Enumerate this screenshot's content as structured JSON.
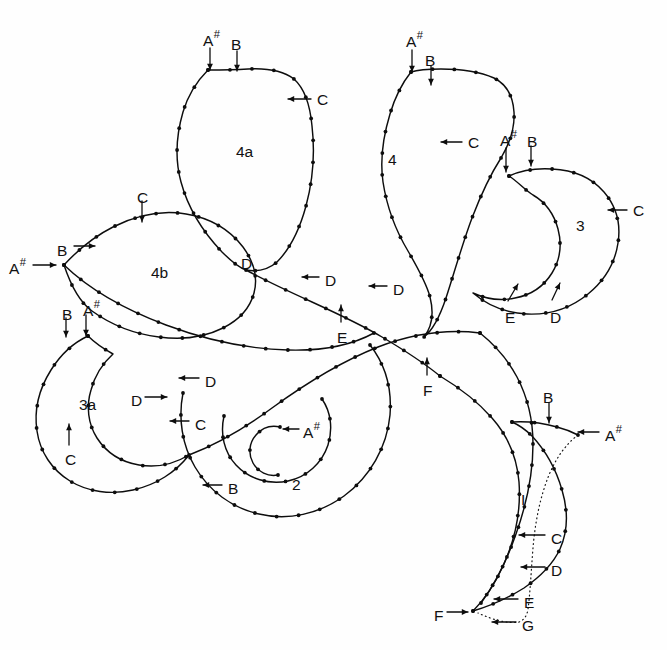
{
  "figure": {
    "type": "line-diagram",
    "background_color": "#fefefe",
    "line_color": "#0d0d0d",
    "canvas": {
      "width": 667,
      "height": 650
    }
  },
  "region_labels": [
    {
      "id": "region-4a",
      "text": "4a",
      "x": 236,
      "y": 144
    },
    {
      "id": "region-4",
      "text": "4",
      "x": 388,
      "y": 152
    },
    {
      "id": "region-3",
      "text": "3",
      "x": 576,
      "y": 218
    },
    {
      "id": "region-4b",
      "text": "4b",
      "x": 151,
      "y": 265
    },
    {
      "id": "region-3a",
      "text": "3a",
      "x": 79,
      "y": 397
    },
    {
      "id": "region-2",
      "text": "2",
      "x": 292,
      "y": 477
    }
  ],
  "landmark_labels": [
    {
      "id": "lbl-4a-asharp",
      "base": "A",
      "sup": "#",
      "x": 203,
      "y": 33
    },
    {
      "id": "lbl-4a-b",
      "base": "B",
      "sup": "",
      "x": 231,
      "y": 37
    },
    {
      "id": "lbl-4a-c",
      "base": "C",
      "sup": "",
      "x": 317,
      "y": 92
    },
    {
      "id": "lbl-4-asharp",
      "base": "A",
      "sup": "#",
      "x": 406,
      "y": 34
    },
    {
      "id": "lbl-4-b",
      "base": "B",
      "sup": "",
      "x": 425,
      "y": 53
    },
    {
      "id": "lbl-4-c",
      "base": "C",
      "sup": "",
      "x": 468,
      "y": 135
    },
    {
      "id": "lbl-3-asharp",
      "base": "A",
      "sup": "#",
      "x": 500,
      "y": 133
    },
    {
      "id": "lbl-3-b",
      "base": "B",
      "sup": "",
      "x": 527,
      "y": 134
    },
    {
      "id": "lbl-3-c",
      "base": "C",
      "sup": "",
      "x": 633,
      "y": 203
    },
    {
      "id": "lbl-3-e",
      "base": "E",
      "sup": "",
      "x": 505,
      "y": 310
    },
    {
      "id": "lbl-3-d",
      "base": "D",
      "sup": "",
      "x": 550,
      "y": 310
    },
    {
      "id": "lbl-4b-c",
      "base": "C",
      "sup": "",
      "x": 137,
      "y": 190
    },
    {
      "id": "lbl-4b-b",
      "base": "B",
      "sup": "",
      "x": 57,
      "y": 243
    },
    {
      "id": "lbl-4b-asharp",
      "base": "A",
      "sup": "#",
      "x": 9,
      "y": 261
    },
    {
      "id": "lbl-3a-b",
      "base": "B",
      "sup": "",
      "x": 62,
      "y": 307
    },
    {
      "id": "lbl-3a-asharp",
      "base": "A",
      "sup": "#",
      "x": 83,
      "y": 303
    },
    {
      "id": "lbl-3a-c",
      "base": "C",
      "sup": "",
      "x": 65,
      "y": 452
    },
    {
      "id": "lbl-4a-d",
      "base": "D",
      "sup": "",
      "x": 241,
      "y": 256
    },
    {
      "id": "lbl-4-dleft",
      "base": "D",
      "sup": "",
      "x": 325,
      "y": 273
    },
    {
      "id": "lbl-4-dright",
      "base": "D",
      "sup": "",
      "x": 393,
      "y": 282
    },
    {
      "id": "lbl-centre-e",
      "base": "E",
      "sup": "",
      "x": 337,
      "y": 330
    },
    {
      "id": "lbl-centre-f",
      "base": "F",
      "sup": "",
      "x": 423,
      "y": 383
    },
    {
      "id": "lbl-2-dupper",
      "base": "D",
      "sup": "",
      "x": 205,
      "y": 374
    },
    {
      "id": "lbl-2-dleft",
      "base": "D",
      "sup": "",
      "x": 131,
      "y": 393
    },
    {
      "id": "lbl-2-c",
      "base": "C",
      "sup": "",
      "x": 195,
      "y": 417
    },
    {
      "id": "lbl-2-asharp",
      "base": "A",
      "sup": "#",
      "x": 303,
      "y": 425
    },
    {
      "id": "lbl-2-b",
      "base": "B",
      "sup": "",
      "x": 228,
      "y": 481
    },
    {
      "id": "lbl-tail-b",
      "base": "B",
      "sup": "",
      "x": 543,
      "y": 390
    },
    {
      "id": "lbl-tail-asharp",
      "base": "A",
      "sup": "#",
      "x": 605,
      "y": 428
    },
    {
      "id": "lbl-tail-i",
      "base": "I",
      "sup": "",
      "x": 521,
      "y": 492
    },
    {
      "id": "lbl-tail-c",
      "base": "C",
      "sup": "",
      "x": 551,
      "y": 531
    },
    {
      "id": "lbl-tail-d",
      "base": "D",
      "sup": "",
      "x": 551,
      "y": 563
    },
    {
      "id": "lbl-tail-e",
      "base": "E",
      "sup": "",
      "x": 524,
      "y": 595
    },
    {
      "id": "lbl-tail-f",
      "base": "F",
      "sup": "",
      "x": 434,
      "y": 608
    },
    {
      "id": "lbl-tail-g",
      "base": "G",
      "sup": "",
      "x": 522,
      "y": 618
    }
  ],
  "arrows": [
    {
      "id": "arrow-4a-asharp",
      "from": [
        210,
        48
      ],
      "to": [
        210,
        70
      ],
      "head": "down"
    },
    {
      "id": "arrow-4a-b",
      "from": [
        237,
        51
      ],
      "to": [
        237,
        71
      ],
      "head": "down"
    },
    {
      "id": "arrow-4a-c",
      "from": [
        311,
        99
      ],
      "to": [
        288,
        99
      ],
      "head": "left"
    },
    {
      "id": "arrow-4-asharp",
      "from": [
        412,
        50
      ],
      "to": [
        412,
        72
      ],
      "head": "down"
    },
    {
      "id": "arrow-4-b",
      "from": [
        431,
        66
      ],
      "to": [
        431,
        85
      ],
      "head": "down"
    },
    {
      "id": "arrow-4-c",
      "from": [
        462,
        142
      ],
      "to": [
        441,
        142
      ],
      "head": "left"
    },
    {
      "id": "arrow-3-asharp",
      "from": [
        506,
        148
      ],
      "to": [
        506,
        172
      ],
      "head": "down"
    },
    {
      "id": "arrow-3-b",
      "from": [
        531,
        146
      ],
      "to": [
        531,
        166
      ],
      "head": "down"
    },
    {
      "id": "arrow-3-c",
      "from": [
        627,
        210
      ],
      "to": [
        608,
        210
      ],
      "head": "left"
    },
    {
      "id": "arrow-3-e",
      "from": [
        508,
        301
      ],
      "to": [
        518,
        284
      ],
      "head": "upright"
    },
    {
      "id": "arrow-3-d",
      "from": [
        552,
        300
      ],
      "to": [
        560,
        283
      ],
      "head": "upright"
    },
    {
      "id": "arrow-4b-c",
      "from": [
        142,
        201
      ],
      "to": [
        142,
        222
      ],
      "head": "down"
    },
    {
      "id": "arrow-4b-b",
      "from": [
        74,
        246
      ],
      "to": [
        95,
        246
      ],
      "head": "right"
    },
    {
      "id": "arrow-4b-asharp",
      "from": [
        33,
        265
      ],
      "to": [
        56,
        265
      ],
      "head": "right"
    },
    {
      "id": "arrow-3a-b",
      "from": [
        66,
        318
      ],
      "to": [
        66,
        337
      ],
      "head": "down"
    },
    {
      "id": "arrow-3a-asharp",
      "from": [
        86,
        315
      ],
      "to": [
        86,
        336
      ],
      "head": "down"
    },
    {
      "id": "arrow-3a-c",
      "from": [
        69,
        445
      ],
      "to": [
        69,
        424
      ],
      "head": "up"
    },
    {
      "id": "arrow-2-dupper",
      "from": [
        199,
        378
      ],
      "to": [
        179,
        378
      ],
      "head": "left"
    },
    {
      "id": "arrow-2-dleft",
      "from": [
        145,
        397
      ],
      "to": [
        167,
        397
      ],
      "head": "right"
    },
    {
      "id": "arrow-2-c",
      "from": [
        189,
        421
      ],
      "to": [
        170,
        421
      ],
      "head": "left"
    },
    {
      "id": "arrow-2-asharp",
      "from": [
        299,
        429
      ],
      "to": [
        283,
        429
      ],
      "head": "left"
    },
    {
      "id": "arrow-2-b",
      "from": [
        222,
        485
      ],
      "to": [
        203,
        485
      ],
      "head": "left"
    },
    {
      "id": "arrow-4-dleft",
      "from": [
        319,
        277
      ],
      "to": [
        302,
        277
      ],
      "head": "left"
    },
    {
      "id": "arrow-4-dright",
      "from": [
        387,
        286
      ],
      "to": [
        369,
        286
      ],
      "head": "left"
    },
    {
      "id": "arrow-centre-e",
      "from": [
        341,
        322
      ],
      "to": [
        341,
        305
      ],
      "head": "up"
    },
    {
      "id": "arrow-centre-f",
      "from": [
        427,
        375
      ],
      "to": [
        427,
        358
      ],
      "head": "up"
    },
    {
      "id": "arrow-tail-b",
      "from": [
        549,
        403
      ],
      "to": [
        549,
        423
      ],
      "head": "down"
    },
    {
      "id": "arrow-tail-asharp",
      "from": [
        599,
        432
      ],
      "to": [
        578,
        432
      ],
      "head": "left"
    },
    {
      "id": "arrow-tail-c",
      "from": [
        545,
        535
      ],
      "to": [
        519,
        535
      ],
      "head": "left"
    },
    {
      "id": "arrow-tail-d",
      "from": [
        545,
        567
      ],
      "to": [
        521,
        567
      ],
      "head": "left"
    },
    {
      "id": "arrow-tail-e",
      "from": [
        518,
        599
      ],
      "to": [
        494,
        599
      ],
      "head": "left"
    },
    {
      "id": "arrow-tail-f",
      "from": [
        447,
        612
      ],
      "to": [
        468,
        612
      ],
      "head": "right"
    },
    {
      "id": "arrow-tail-g",
      "from": [
        516,
        622
      ],
      "to": [
        492,
        622
      ],
      "head": "left"
    }
  ],
  "outlines": {
    "lobe_4a": "M 208,70 C 198,80 188,95 183,112 C 176,136 175,160 181,182 C 188,208 203,232 222,252 C 232,262 240,268 246,270 C 258,272 268,270 277,262 C 290,249 300,228 306,206 C 313,180 315,152 312,126 C 310,104 304,88 294,79 C 282,70 266,68 248,69 C 232,70 218,70 208,70 Z",
    "lobe_4": "M 411,72 C 403,82 395,97 390,114 C 383,137 380,161 383,182 C 387,208 396,231 408,251 C 419,270 427,285 430,297 C 434,313 432,327 424,337 C 433,330 440,316 446,298 C 455,270 463,242 472,218 C 482,192 492,172 501,158 C 510,143 515,128 514,112 C 513,96 506,84 494,78 C 478,71 459,69 441,69 C 426,69 417,70 411,72 Z",
    "lobe_3": "M 509,176 C 520,171 536,168 552,169 C 574,170 592,178 604,192 C 616,206 621,224 618,243 C 615,263 604,281 588,294 C 571,308 549,315 527,314 C 506,313 487,305 473,293 C 486,299 501,301 515,298 C 531,295 544,286 552,273 C 560,260 562,244 558,229 C 554,214 545,202 533,195 C 525,190 517,181 509,176 Z",
    "lobe_4b": "M 64,265 C 76,252 93,237 113,227 C 137,215 163,210 186,214 C 210,218 230,230 243,247 C 254,262 258,278 254,293 C 250,308 239,320 223,328 C 205,337 182,340 159,337 C 134,334 110,324 92,311 C 78,301 70,283 64,265 Z",
    "lobe_3a": "M 88,336 C 75,342 61,354 51,370 C 39,389 34,411 37,431 C 40,452 52,470 70,481 C 88,492 111,495 133,490 C 156,485 176,472 189,455 C 174,464 156,468 139,465 C 121,462 106,452 97,438 C 88,424 86,406 91,390 C 95,375 103,363 113,354 C 104,349 95,343 88,336 Z",
    "lobe_2_outer": "M 183,393 C 178,418 182,445 195,467 C 209,491 232,508 259,514 C 288,521 319,514 344,496 C 370,477 387,447 390,415 C 392,389 385,364 370,345",
    "lobe_2_inner": "M 224,416 C 220,434 224,452 236,465 C 249,479 269,485 288,481 C 307,477 322,463 328,445 C 333,429 331,412 322,399",
    "lobe_2_core": "M 280,427 C 271,425 262,428 256,435 C 249,443 248,454 253,463 C 258,472 268,477 278,475",
    "main_stem_upper": "M 246,270 C 266,281 290,292 312,302 C 336,313 360,324 382,337 C 404,350 424,363 440,376",
    "main_stem_left": "M 64,265 C 90,290 126,310 166,325 C 206,340 248,349 288,350 C 322,351 352,345 374,333",
    "main_sweep": "M 189,455 C 215,445 245,428 272,408 C 305,384 340,362 378,347 C 412,334 448,329 480,333",
    "tail_outer": "M 440,376 C 460,388 478,402 492,418 C 508,436 517,458 519,482 C 521,510 515,540 503,566 C 494,586 483,601 473,611",
    "tail_inner": "M 480,333 C 495,345 508,360 517,377 C 528,398 533,421 533,444 C 533,472 527,503 516,534 C 507,560 495,584 481,603",
    "tail_hook": "M 473,611 C 490,606 508,598 524,588 C 540,577 553,564 560,549 C 568,531 568,510 562,490 C 556,469 545,450 532,436 C 526,430 519,425 512,422",
    "tail_cap": "M 512,422 C 527,421 543,423 557,427 C 565,429 572,432 578,435",
    "tail_dotted": "M 578,435 C 566,444 556,458 549,475 C 540,497 535,523 533,548 C 531,573 530,595 528,609 C 527,616 524,620 519,622 C 508,624 493,620 478,613"
  },
  "landmark_dots": {
    "description": "Small filled circles sampled at roughly equal arc-length along every outline path.",
    "radius": 1.9,
    "spacing_px": 22
  }
}
